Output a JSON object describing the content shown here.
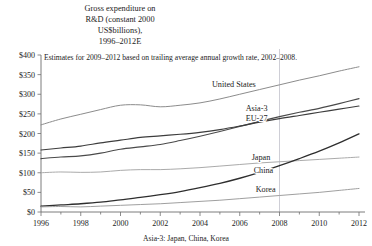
{
  "chart_data": {
    "type": "line",
    "title_lines": [
      "Gross expenditure on",
      "R&D (constant 2000",
      "US$billions),",
      "1996–2012E"
    ],
    "subtitle": "Estimates for 2009–2012 based on trailing average annual growth rate, 2002–2008.",
    "footnote": "Asia-3: Japan, China, Korea",
    "xlabel": "",
    "ylabel": "",
    "x": [
      1996,
      1997,
      1998,
      1999,
      2000,
      2001,
      2002,
      2003,
      2004,
      2005,
      2006,
      2007,
      2008,
      2009,
      2010,
      2011,
      2012
    ],
    "xlim": [
      1996,
      2012
    ],
    "ylim": [
      0,
      400
    ],
    "ytick_values": [
      0,
      50,
      100,
      150,
      200,
      250,
      300,
      350,
      400
    ],
    "ytick_labels": [
      "$0",
      "$50",
      "$100",
      "$150",
      "$200",
      "$250",
      "$300",
      "$350",
      "$400"
    ],
    "xtick_values": [
      1996,
      1998,
      2000,
      2002,
      2004,
      2006,
      2008,
      2010,
      2012
    ],
    "xtick_labels": [
      "1996",
      "1998",
      "2000",
      "2002",
      "2004",
      "2006",
      "2008",
      "2010",
      "2012"
    ],
    "xminor_values": [
      1997,
      1999,
      2001,
      2003,
      2005,
      2007,
      2009,
      2011
    ],
    "grid": false,
    "legend_position": "inline-right-labels",
    "estimate_divider_year": 2008,
    "series": [
      {
        "name": "United States",
        "color": "#8c8c8c",
        "width": 1.0,
        "label_x": 2004.6,
        "label_y": 318,
        "values": [
          222,
          237,
          249,
          261,
          272,
          273,
          268,
          272,
          278,
          288,
          300,
          312,
          324,
          336,
          347,
          359,
          370
        ]
      },
      {
        "name": "Asia-3",
        "color": "#4a4a4a",
        "width": 1.15,
        "label_x": 2006.3,
        "label_y": 258,
        "values": [
          136,
          140,
          143,
          150,
          160,
          166,
          172,
          182,
          193,
          205,
          218,
          231,
          243,
          254,
          264,
          276,
          289
        ]
      },
      {
        "name": "EU-27",
        "color": "#3d3d3d",
        "width": 1.15,
        "label_x": 2006.3,
        "label_y": 231,
        "values": [
          158,
          163,
          168,
          176,
          183,
          190,
          194,
          198,
          203,
          210,
          219,
          229,
          238,
          246,
          254,
          262,
          270
        ]
      },
      {
        "name": "Japan",
        "color": "#a5a5a5",
        "width": 0.95,
        "label_x": 2006.6,
        "label_y": 132,
        "values": [
          100,
          102,
          101,
          102,
          106,
          108,
          108,
          110,
          113,
          117,
          121,
          125,
          128,
          131,
          134,
          137,
          140
        ]
      },
      {
        "name": "China",
        "color": "#2e2e2e",
        "width": 1.3,
        "label_x": 2006.7,
        "label_y": 100,
        "values": [
          15,
          18,
          21,
          25,
          31,
          37,
          44,
          52,
          62,
          73,
          86,
          101,
          118,
          136,
          155,
          176,
          199
        ]
      },
      {
        "name": "Korea",
        "color": "#9a9a9a",
        "width": 0.95,
        "label_x": 2006.8,
        "label_y": 52,
        "values": [
          13,
          14,
          13,
          15,
          17,
          19,
          21,
          24,
          27,
          30,
          34,
          38,
          42,
          46,
          50,
          55,
          60
        ]
      }
    ]
  }
}
